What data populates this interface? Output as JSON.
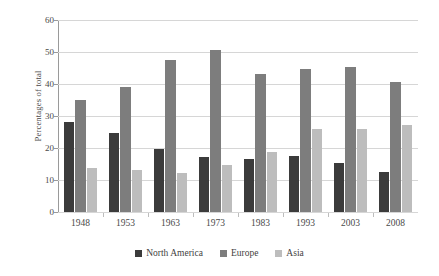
{
  "chart_data": {
    "type": "bar",
    "title": "",
    "subtitle": "",
    "xlabel": "",
    "ylabel": "Percentages of total",
    "ylim": [
      0,
      60
    ],
    "yticks": [
      0,
      10,
      20,
      30,
      40,
      50,
      60
    ],
    "ytick_labels": [
      "0",
      "10",
      "20",
      "30",
      "40",
      "50",
      "60"
    ],
    "grid": true,
    "legend_position": "bottom",
    "categories": [
      "1948",
      "1953",
      "1963",
      "1973",
      "1983",
      "1993",
      "2003",
      "2008"
    ],
    "series": [
      {
        "name": "North America",
        "color": "#3b3b3b",
        "values": [
          28.1,
          24.8,
          19.8,
          17.1,
          16.5,
          17.6,
          15.3,
          12.6
        ]
      },
      {
        "name": "Europe",
        "color": "#7d7d7d",
        "values": [
          35.0,
          39.2,
          47.5,
          50.7,
          43.2,
          44.8,
          45.4,
          40.5
        ]
      },
      {
        "name": "Asia",
        "color": "#bdbdbd",
        "values": [
          13.8,
          13.2,
          12.3,
          14.7,
          18.8,
          25.8,
          25.8,
          27.1
        ]
      }
    ]
  },
  "legend": {
    "items": [
      {
        "label": "North America",
        "color": "#3b3b3b"
      },
      {
        "label": "Europe",
        "color": "#7d7d7d"
      },
      {
        "label": "Asia",
        "color": "#bdbdbd"
      }
    ]
  },
  "axes": {
    "y_title": "Percentages of total"
  },
  "colors": {
    "gridline": "#d6d6d6",
    "axis": "#9a9a9a",
    "text": "#4a4a4a",
    "background": "#ffffff"
  }
}
